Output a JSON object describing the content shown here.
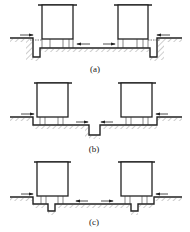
{
  "figure": {
    "panels": [
      {
        "id": "a",
        "caption": "(a)",
        "description": "Two foundations with edge trenches at outer sides; flow arrows toward outer trenches"
      },
      {
        "id": "b",
        "caption": "(b)",
        "description": "Two foundations with a single central trench between them; flow arrows toward center"
      },
      {
        "id": "c",
        "caption": "(c)",
        "description": "Two foundations each with a trench beneath; flow arrows toward each foundation"
      }
    ]
  },
  "colors": {
    "line": "#222222",
    "hatch": "#555555",
    "background": "#ffffff"
  }
}
